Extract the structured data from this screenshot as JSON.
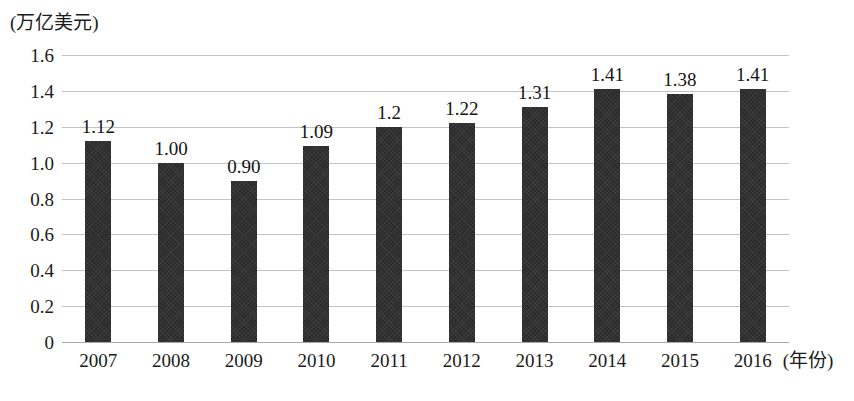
{
  "chart_data": {
    "type": "bar",
    "title": "",
    "subtitle": "",
    "xlabel": "(年份)",
    "ylabel": "(万亿美元)",
    "categories": [
      "2007",
      "2008",
      "2009",
      "2010",
      "2011",
      "2012",
      "2013",
      "2014",
      "2015",
      "2016"
    ],
    "values": [
      1.12,
      1.0,
      0.9,
      1.09,
      1.2,
      1.22,
      1.31,
      1.41,
      1.38,
      1.41
    ],
    "value_labels": [
      "1.12",
      "1.00",
      "0.90",
      "1.09",
      "1.2",
      "1.22",
      "1.31",
      "1.41",
      "1.38",
      "1.41"
    ],
    "ylim": [
      0,
      1.6
    ],
    "yticks": [
      0,
      0.2,
      0.4,
      0.6,
      0.8,
      1.0,
      1.2,
      1.4,
      1.6
    ],
    "ytick_labels": [
      "0",
      "0.2",
      "0.4",
      "0.6",
      "0.8",
      "1.0",
      "1.2",
      "1.4",
      "1.6"
    ],
    "grid": true,
    "grid_axis": "y",
    "legend": false,
    "legend_position": "none",
    "series": [
      {
        "name": "",
        "values": [
          1.12,
          1.0,
          0.9,
          1.09,
          1.2,
          1.22,
          1.31,
          1.41,
          1.38,
          1.41
        ],
        "color": "#2c2b2b"
      }
    ],
    "colors": {
      "bar": "#2c2b2b",
      "gridline": "#c3c3c3",
      "axis": "#a9a9a9",
      "text": "#1b1b1b",
      "background": "#ffffff"
    }
  }
}
